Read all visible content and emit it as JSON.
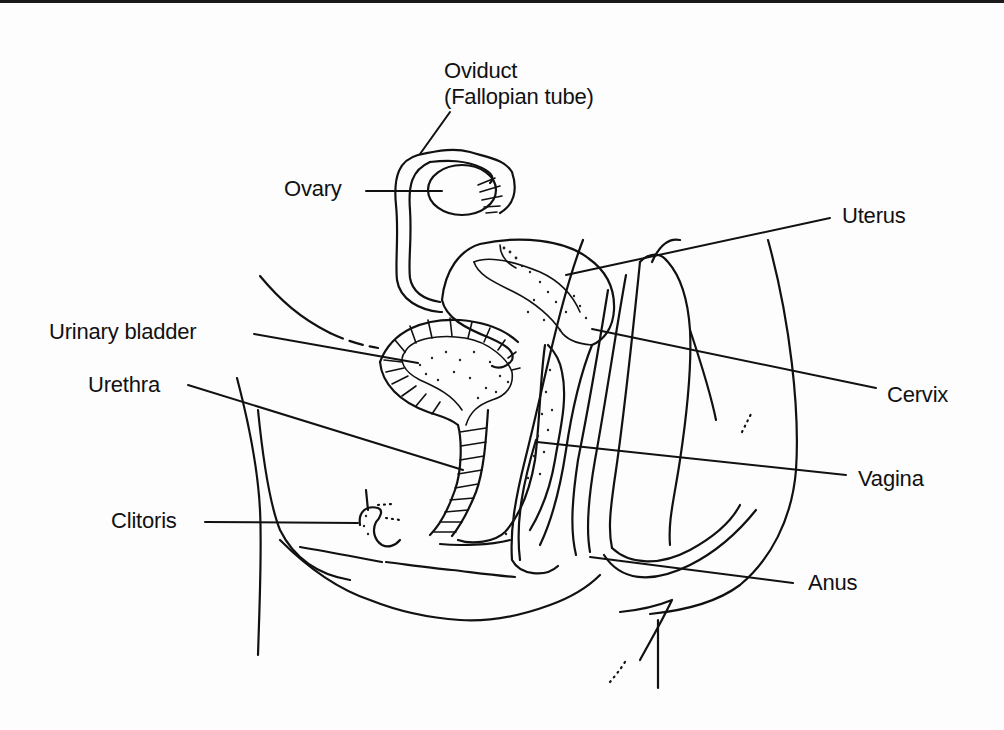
{
  "diagram": {
    "type": "anatomical-line-drawing",
    "labels": [
      {
        "id": "oviduct",
        "text_line1": "Oviduct",
        "text_line2": "(Fallopian tube)"
      },
      {
        "id": "ovary",
        "text": "Ovary"
      },
      {
        "id": "uterus",
        "text": "Uterus"
      },
      {
        "id": "urinary-bladder",
        "text": "Urinary bladder"
      },
      {
        "id": "urethra",
        "text": "Urethra"
      },
      {
        "id": "cervix",
        "text": "Cervix"
      },
      {
        "id": "vagina",
        "text": "Vagina"
      },
      {
        "id": "clitoris",
        "text": "Clitoris"
      },
      {
        "id": "anus",
        "text": "Anus"
      }
    ]
  },
  "colors": {
    "line": "#111111",
    "background": "#fdfdfd",
    "top_rule": "#1a1a1a"
  }
}
